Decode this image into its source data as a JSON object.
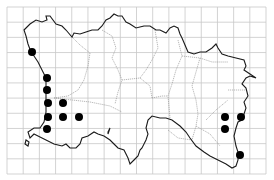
{
  "map": {
    "title": "Distribution map (grid squares)",
    "grid": {
      "left": 7,
      "top": 7,
      "right": 266,
      "bottom": 174,
      "cols": 16,
      "rows": 11,
      "color": "#c8c8c8"
    },
    "colors": {
      "coast": "#1a1a1a",
      "parish": "#8a8a8a",
      "dot": "#000000",
      "background": "#ffffff"
    },
    "records": [
      {
        "x": 32,
        "y": 52
      },
      {
        "x": 47,
        "y": 78
      },
      {
        "x": 47,
        "y": 90
      },
      {
        "x": 48,
        "y": 103
      },
      {
        "x": 63,
        "y": 103
      },
      {
        "x": 48,
        "y": 117
      },
      {
        "x": 63,
        "y": 117
      },
      {
        "x": 79,
        "y": 117
      },
      {
        "x": 47,
        "y": 129
      },
      {
        "x": 225,
        "y": 117
      },
      {
        "x": 241,
        "y": 117
      },
      {
        "x": 225,
        "y": 129
      },
      {
        "x": 240,
        "y": 155
      }
    ]
  }
}
